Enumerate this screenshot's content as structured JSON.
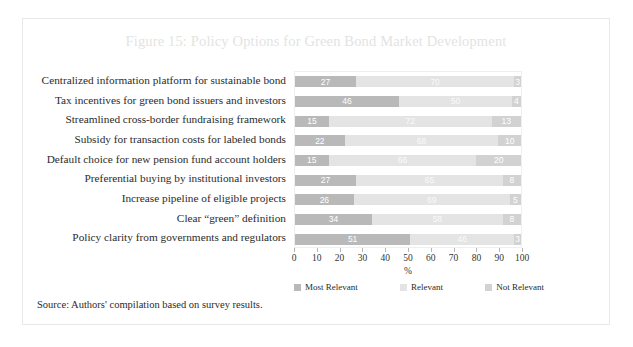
{
  "figure": {
    "title": "Figure 15: Policy Options for Green Bond Market Development",
    "source": "Source: Authors' compilation based on survey results."
  },
  "chart_data": {
    "type": "bar",
    "orientation": "horizontal",
    "stacked": true,
    "title": "Figure 15: Policy Options for Green Bond Market Development",
    "xlabel": "%",
    "ylabel": "",
    "xlim": [
      0,
      100
    ],
    "xticks": [
      0,
      10,
      20,
      30,
      40,
      50,
      60,
      70,
      80,
      90,
      100
    ],
    "grid": false,
    "legend_position": "bottom",
    "categories": [
      "Centralized information platform for sustainable bond",
      "Tax incentives for green bond issuers and investors",
      "Streamlined cross-border fundraising framework",
      "Subsidy for transaction costs for labeled bonds",
      "Default choice for new pension fund account holders",
      "Preferential buying by institutional investors",
      "Increase pipeline of eligible projects",
      "Clear “green” definition",
      "Policy clarity from governments and regulators"
    ],
    "series": [
      {
        "name": "Most Relevant",
        "color": "#b9b9b9",
        "values": [
          27,
          46,
          15,
          22,
          15,
          27,
          26,
          34,
          51
        ]
      },
      {
        "name": "Relevant",
        "color": "#e4e4e4",
        "values": [
          70,
          50,
          72,
          68,
          66,
          65,
          69,
          58,
          46
        ]
      },
      {
        "name": "Not Relevant",
        "color": "#d2d2d2",
        "values": [
          3,
          4,
          13,
          10,
          20,
          8,
          5,
          8,
          3
        ]
      }
    ]
  }
}
